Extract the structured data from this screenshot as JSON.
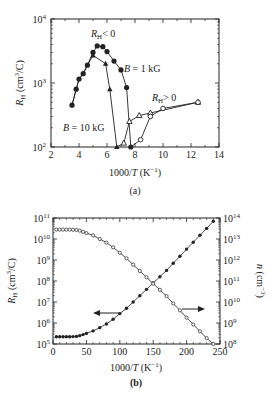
{
  "chart_data": [
    {
      "id": "a",
      "type": "line",
      "caption": "(a)",
      "xlabel": "1000/T (K^-1)",
      "ylabel": "R_H (cm^3/C)",
      "xlim": [
        2,
        14
      ],
      "ylim": [
        100,
        10000
      ],
      "yscale": "log",
      "xticks": [
        "2",
        "4",
        "6",
        "8",
        "10",
        "12",
        "14"
      ],
      "yticks": [
        "10^2",
        "10^3",
        "10^4"
      ],
      "annotations": [
        "R_H < 0",
        "B = 1 kG",
        "B = 10 kG",
        "R_H > 0"
      ],
      "series": [
        {
          "name": "B = 1 kG (R_H < 0)",
          "marker": "filled-circle",
          "x": [
            3.5,
            3.8,
            4.0,
            4.3,
            4.6,
            5.0,
            5.3,
            5.7,
            6.0,
            6.5,
            7.0,
            7.4,
            7.7
          ],
          "y": [
            450,
            800,
            1150,
            1400,
            1900,
            3000,
            3800,
            3700,
            3100,
            2200,
            1600,
            850,
            100
          ]
        },
        {
          "name": "B = 10 kG (R_H < 0)",
          "marker": "filled-triangle",
          "x": [
            5.0,
            5.9,
            6.2,
            6.7
          ],
          "y": [
            2700,
            2000,
            800,
            100
          ]
        },
        {
          "name": "B = 10 kG (R_H > 0)",
          "marker": "open-triangle",
          "x": [
            7.2,
            7.6,
            8.3,
            9.1,
            12.5
          ],
          "y": [
            115,
            250,
            310,
            340,
            500
          ]
        },
        {
          "name": "B = 1 kG (R_H > 0)",
          "marker": "open-circle",
          "x": [
            8.4,
            9.1,
            10.0,
            12.5
          ],
          "y": [
            130,
            300,
            400,
            500
          ]
        }
      ]
    },
    {
      "id": "b",
      "type": "line",
      "caption": "(b)",
      "xlabel": "1000/T (K^-1)",
      "ylabel": "R_H (cm^3/C)",
      "ylabel_right": "n (cm^-3)",
      "xlim": [
        0,
        250
      ],
      "ylim": [
        100000.0,
        100000000000.0
      ],
      "ylim_right": [
        100000000.0,
        100000000000000.0
      ],
      "yscale": "log",
      "xticks": [
        "0",
        "50",
        "100",
        "150",
        "200",
        "250"
      ],
      "yticks": [
        "10^5",
        "10^6",
        "10^7",
        "10^8",
        "10^9",
        "10^10",
        "10^11"
      ],
      "yticks_right": [
        "10^8",
        "10^9",
        "10^10",
        "10^11",
        "10^12",
        "10^13",
        "10^14"
      ],
      "annotations": [
        "arrow pointing left (R_H axis)",
        "arrow pointing right (n axis)"
      ],
      "series": [
        {
          "name": "R_H",
          "axis": "left",
          "marker": "filled-circle",
          "x": [
            5,
            10,
            15,
            20,
            25,
            30,
            35,
            40,
            45,
            50,
            60,
            70,
            80,
            90,
            100,
            110,
            120,
            130,
            140,
            150,
            160,
            170,
            180,
            190,
            200,
            210,
            220,
            230,
            240
          ],
          "y": [
            220000.0,
            220000.0,
            220000.0,
            220000.0,
            220000.0,
            225000.0,
            230000.0,
            250000.0,
            280000.0,
            320000.0,
            420000.0,
            600000.0,
            900000.0,
            1500000.0,
            2800000.0,
            5000000.0,
            10000000.0,
            20000000.0,
            40000000.0,
            80000000.0,
            160000000.0,
            320000000.0,
            700000000.0,
            1500000000.0,
            3300000000.0,
            7000000000.0,
            15000000000.0,
            32000000000.0,
            70000000000.0
          ]
        },
        {
          "name": "n",
          "axis": "right",
          "marker": "open-circle",
          "x": [
            5,
            10,
            15,
            20,
            25,
            30,
            35,
            40,
            45,
            50,
            60,
            70,
            80,
            90,
            100,
            110,
            120,
            130,
            140,
            150,
            160,
            170,
            180,
            190,
            200,
            210,
            220,
            230,
            240
          ],
          "y": [
            28000000000000.0,
            28000000000000.0,
            28000000000000.0,
            28000000000000.0,
            28000000000000.0,
            27500000000000.0,
            27000000000000.0,
            25000000000000.0,
            22000000000000.0,
            19000000000000.0,
            15000000000000.0,
            10000000000000.0,
            6700000000000.0,
            4000000000000.0,
            2200000000000.0,
            1200000000000.0,
            600000000000.0,
            300000000000.0,
            150000000000.0,
            75000000000.0,
            38000000000.0,
            19000000000.0,
            8500000000.0,
            4000000000.0,
            1800000000.0,
            850000000.0,
            400000000.0,
            190000000.0,
            100000000.0
          ]
        }
      ]
    }
  ],
  "labels": {
    "a": {
      "xlabel_num": "1000/",
      "xlabel_var": "T",
      "xlabel_unit": " (K",
      "xlabel_exp": "−1",
      "xlabel_end": ")",
      "ylabel_var": "R",
      "ylabel_sub": "H",
      "ylabel_unit": " (cm",
      "ylabel_exp": "3",
      "ylabel_end": "/C)",
      "annot_rh_neg": "< 0",
      "annot_rh_pos": "> 0",
      "annot_b1": "B",
      "annot_b1_val": " = 1 kG",
      "annot_b10": "B",
      "annot_b10_val": " = 10 kG",
      "caption": "(a)"
    },
    "b": {
      "caption": "(b)",
      "ylabel_right_var": "n",
      "ylabel_right_unit": " (cm",
      "ylabel_right_exp": "−3",
      "ylabel_right_end": ")"
    }
  }
}
